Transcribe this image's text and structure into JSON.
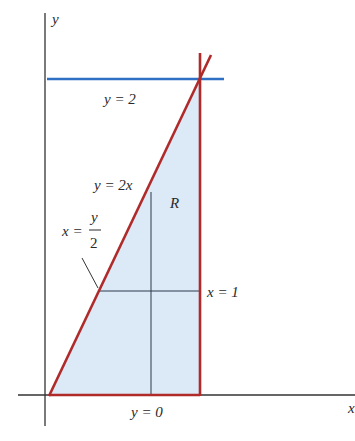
{
  "diagram": {
    "colors": {
      "axis": "#333333",
      "boundary_red": "#b02a2a",
      "line_blue": "#2f6fc4",
      "region_fill": "#dce9f6",
      "guide_line": "#2a3a4a"
    },
    "labels": {
      "y_axis": "y",
      "x_axis": "x",
      "horizontal_line": "y = 2",
      "diagonal": "y = 2x",
      "diagonal_alt_x": "x =",
      "diagonal_alt_num": "y",
      "diagonal_alt_den": "2",
      "vertical_bound": "x = 1",
      "bottom_bound": "y = 0",
      "region": "R"
    }
  }
}
